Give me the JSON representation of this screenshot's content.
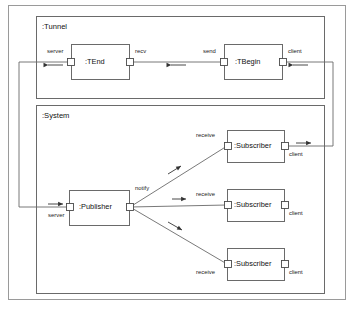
{
  "diagram": {
    "type": "uml-component-diagram",
    "stroke_color": "#555555",
    "text_color": "#1a1a1a",
    "background": "#ffffff",
    "outer_frame": {
      "label": ""
    },
    "frames": [
      {
        "id": "tunnel",
        "label": ":Tunnel",
        "x": 36,
        "y": 16,
        "w": 288,
        "h": 82
      },
      {
        "id": "system",
        "label": ":System",
        "x": 36,
        "y": 105,
        "w": 288,
        "h": 188
      }
    ],
    "components": [
      {
        "id": "tend",
        "label": ":TEnd",
        "frame": "tunnel",
        "x": 71,
        "y": 44,
        "w": 58,
        "h": 35,
        "ports": [
          {
            "name": "server",
            "label": "server",
            "side": "left",
            "label_pos": "above"
          },
          {
            "name": "recv",
            "label": "recv",
            "side": "right",
            "label_pos": "above"
          }
        ]
      },
      {
        "id": "tbegin",
        "label": ":TBegin",
        "frame": "tunnel",
        "x": 224,
        "y": 44,
        "w": 58,
        "h": 35,
        "ports": [
          {
            "name": "send",
            "label": "send",
            "side": "left",
            "label_pos": "above"
          },
          {
            "name": "client",
            "label": "client",
            "side": "right",
            "label_pos": "above"
          }
        ]
      },
      {
        "id": "publisher",
        "label": ":Publisher",
        "frame": "system",
        "x": 69,
        "y": 190,
        "w": 60,
        "h": 35,
        "ports": [
          {
            "name": "server",
            "label": "server",
            "side": "left",
            "label_pos": "below"
          },
          {
            "name": "notify",
            "label": "notify",
            "side": "right",
            "label_pos": "above"
          }
        ]
      },
      {
        "id": "subscriber1",
        "label": ":Subscriber",
        "frame": "system",
        "x": 227,
        "y": 130,
        "w": 57,
        "h": 32,
        "ports": [
          {
            "name": "receive",
            "label": "receive",
            "side": "left",
            "label_pos": "above"
          },
          {
            "name": "client",
            "label": "client",
            "side": "right",
            "label_pos": "below"
          }
        ]
      },
      {
        "id": "subscriber2",
        "label": ":Subscriber",
        "frame": "system",
        "x": 227,
        "y": 189,
        "w": 57,
        "h": 32,
        "ports": [
          {
            "name": "receive",
            "label": "receive",
            "side": "left",
            "label_pos": "above"
          },
          {
            "name": "client",
            "label": "client",
            "side": "right",
            "label_pos": "below"
          }
        ]
      },
      {
        "id": "subscriber3",
        "label": ":Subscriber",
        "frame": "system",
        "x": 227,
        "y": 248,
        "w": 57,
        "h": 32,
        "ports": [
          {
            "name": "receive",
            "label": "receive",
            "side": "left",
            "label_pos": "below"
          },
          {
            "name": "client",
            "label": "client",
            "side": "right",
            "label_pos": "below"
          }
        ]
      }
    ],
    "connections": [
      {
        "id": "recv-to-send",
        "from": "tend.recv",
        "to": "tbegin.send",
        "arrow": "left"
      },
      {
        "id": "tend-server-to-publisher-server",
        "from": "tend.server",
        "to": "publisher.server",
        "routing": "orthogonal-left",
        "arrows": [
          "left",
          "right"
        ]
      },
      {
        "id": "tbegin-client-to-subscriber1-client",
        "from": "tbegin.client",
        "to": "subscriber1.client",
        "routing": "orthogonal-right",
        "arrows": [
          "left",
          "right"
        ]
      },
      {
        "id": "notify-to-subscriber1-receive",
        "from": "publisher.notify",
        "to": "subscriber1.receive",
        "arrow": "up-right"
      },
      {
        "id": "notify-to-subscriber2-receive",
        "from": "publisher.notify",
        "to": "subscriber2.receive",
        "arrow": "right"
      },
      {
        "id": "notify-to-subscriber3-receive",
        "from": "publisher.notify",
        "to": "subscriber3.receive",
        "arrow": "down-right"
      }
    ]
  }
}
